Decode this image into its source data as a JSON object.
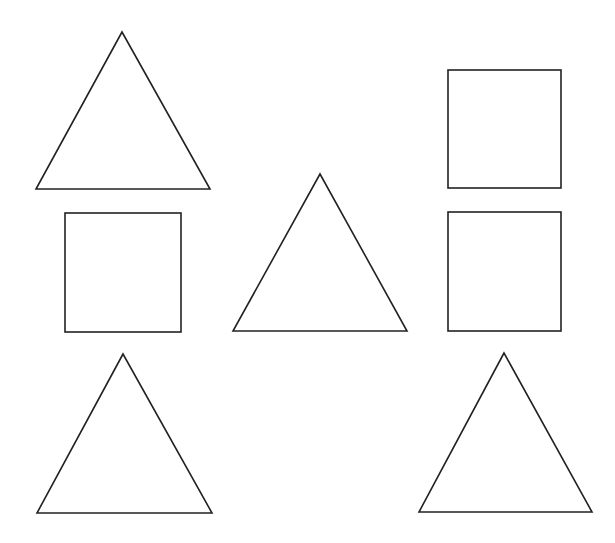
{
  "canvas": {
    "width": 615,
    "height": 543,
    "background": "#ffffff"
  },
  "style": {
    "stroke": "#222222",
    "stroke_width": 1.6,
    "fill": "#ffffff"
  },
  "shapes": [
    {
      "id": "triangle-top-left",
      "type": "triangle",
      "points": [
        [
          122,
          32
        ],
        [
          36,
          189
        ],
        [
          210,
          189
        ]
      ]
    },
    {
      "id": "square-top-right",
      "type": "square",
      "x": 448,
      "y": 70,
      "width": 113,
      "height": 118
    },
    {
      "id": "square-middle-left",
      "type": "square",
      "x": 65,
      "y": 213,
      "width": 116,
      "height": 119
    },
    {
      "id": "triangle-middle-center",
      "type": "triangle",
      "points": [
        [
          320,
          174
        ],
        [
          233,
          331
        ],
        [
          407,
          331
        ]
      ]
    },
    {
      "id": "square-middle-right",
      "type": "square",
      "x": 448,
      "y": 212,
      "width": 113,
      "height": 119
    },
    {
      "id": "triangle-bottom-left",
      "type": "triangle",
      "points": [
        [
          123,
          354
        ],
        [
          37,
          513
        ],
        [
          212,
          513
        ]
      ]
    },
    {
      "id": "triangle-bottom-right",
      "type": "triangle",
      "points": [
        [
          504,
          353
        ],
        [
          419,
          512
        ],
        [
          592,
          512
        ]
      ]
    }
  ]
}
